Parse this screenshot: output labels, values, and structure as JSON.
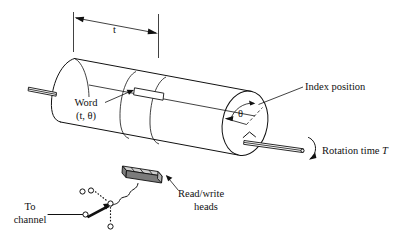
{
  "figure": {
    "type": "technical-line-diagram",
    "background": "#ffffff",
    "ink": "#111111"
  },
  "labels": {
    "dimension_t": "t",
    "word_line1": "Word",
    "word_line2": "(t, θ)",
    "index_position": "Index position",
    "theta": "θ",
    "rotation_time_prefix": "Rotation time ",
    "rotation_time_symbol": "T",
    "read_write_line1": "Read/write",
    "read_write_line2": "heads",
    "to_channel_line1": "To",
    "to_channel_line2": "channel"
  },
  "parts": {
    "drum": "rotating-cylinder-drum",
    "drum_left_end": "partial-ellipse-back-face",
    "drum_right_end": "full-ellipse-front-face",
    "track_bands": 2,
    "word_cell": "hatched-word-cell",
    "left_shaft": "left-shaft-stub",
    "right_shaft": "right-shaft-with-rotation-arrow",
    "rotation_arrow": "curved-rotation-arrow",
    "theta_arc": "angle-arc-theta",
    "index_radius": "dashed-index-radius",
    "head_block": "read-write-head-block",
    "switch": "channel-selector-switch",
    "switch_contacts": 4,
    "leader_lines": 5
  }
}
